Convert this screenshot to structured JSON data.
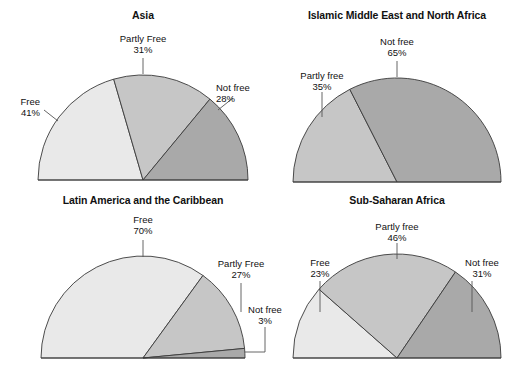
{
  "figure": {
    "width": 517,
    "height": 369,
    "background": "#ffffff"
  },
  "palette": {
    "free": "#e9e9e9",
    "partly_free": "#c6c6c6",
    "not_free": "#a9a9a9",
    "outline": "#3a3a3a",
    "leader": "#555555",
    "text": "#111111"
  },
  "chart_data": [
    {
      "type": "pie",
      "variant": "semicircle",
      "title": "Asia",
      "labels": [
        "Free",
        "Partly Free",
        "Not free"
      ],
      "values": [
        41,
        31,
        28
      ],
      "value_labels": [
        "41%",
        "31%",
        "28%"
      ],
      "units": "percent",
      "legend": "none",
      "grid": false,
      "colors": [
        "#e9e9e9",
        "#c6c6c6",
        "#a9a9a9"
      ]
    },
    {
      "type": "pie",
      "variant": "semicircle",
      "title": "Islamic Middle East and North Africa",
      "labels": [
        "Partly free",
        "Not free"
      ],
      "values": [
        35,
        65
      ],
      "value_labels": [
        "35%",
        "65%"
      ],
      "units": "percent",
      "legend": "none",
      "grid": false,
      "colors": [
        "#c6c6c6",
        "#a9a9a9"
      ]
    },
    {
      "type": "pie",
      "variant": "semicircle",
      "title": "Latin America and the Caribbean",
      "labels": [
        "Free",
        "Partly Free",
        "Not free"
      ],
      "values": [
        70,
        27,
        3
      ],
      "value_labels": [
        "70%",
        "27%",
        "3%"
      ],
      "units": "percent",
      "legend": "none",
      "grid": false,
      "colors": [
        "#e9e9e9",
        "#c6c6c6",
        "#a9a9a9"
      ]
    },
    {
      "type": "pie",
      "variant": "semicircle",
      "title": "Sub-Saharan Africa",
      "labels": [
        "Free",
        "Partly free",
        "Not free"
      ],
      "values": [
        23,
        46,
        31
      ],
      "value_labels": [
        "23%",
        "46%",
        "31%"
      ],
      "units": "percent",
      "legend": "none",
      "grid": false,
      "colors": [
        "#e9e9e9",
        "#c6c6c6",
        "#a9a9a9"
      ]
    }
  ],
  "charts": [
    {
      "id": "asia",
      "title": "Asia",
      "annotations": [
        {
          "name": "free",
          "label": "Free",
          "value": "41%"
        },
        {
          "name": "partly-free",
          "label": "Partly Free",
          "value": "31%"
        },
        {
          "name": "not-free",
          "label": "Not free",
          "value": "28%"
        }
      ]
    },
    {
      "id": "islamic-middle-east-north-africa",
      "title": "Islamic Middle East and North Africa",
      "annotations": [
        {
          "name": "partly-free",
          "label": "Partly free",
          "value": "35%"
        },
        {
          "name": "not-free",
          "label": "Not free",
          "value": "65%"
        }
      ]
    },
    {
      "id": "latin-america-caribbean",
      "title": "Latin America and the Caribbean",
      "annotations": [
        {
          "name": "free",
          "label": "Free",
          "value": "70%"
        },
        {
          "name": "partly-free",
          "label": "Partly Free",
          "value": "27%"
        },
        {
          "name": "not-free",
          "label": "Not free",
          "value": "3%"
        }
      ]
    },
    {
      "id": "sub-saharan-africa",
      "title": "Sub-Saharan Africa",
      "annotations": [
        {
          "name": "free",
          "label": "Free",
          "value": "23%"
        },
        {
          "name": "partly-free",
          "label": "Partly free",
          "value": "46%"
        },
        {
          "name": "not-free",
          "label": "Not free",
          "value": "31%"
        }
      ]
    }
  ]
}
